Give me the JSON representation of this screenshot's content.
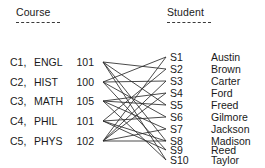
{
  "headers": {
    "course": "Course",
    "student": "Student"
  },
  "courses": [
    {
      "id": "C1,",
      "name": "ENGL",
      "number": "101"
    },
    {
      "id": "C2,",
      "name": "HIST",
      "number": "100"
    },
    {
      "id": "C3,",
      "name": "MATH",
      "number": "105"
    },
    {
      "id": "C4,",
      "name": "PHIL",
      "number": "101"
    },
    {
      "id": "C5,",
      "name": "PHYS",
      "number": "102"
    }
  ],
  "students": [
    {
      "id": "S1",
      "name": "Austin"
    },
    {
      "id": "S2",
      "name": "Brown"
    },
    {
      "id": "S3",
      "name": "Carter"
    },
    {
      "id": "S4",
      "name": "Ford"
    },
    {
      "id": "S5",
      "name": "Freed"
    },
    {
      "id": "S6",
      "name": "Gilmore"
    },
    {
      "id": "S7",
      "name": "Jackson"
    },
    {
      "id": "S8",
      "name": "Madison"
    },
    {
      "id": "S9",
      "name": "Reed"
    },
    {
      "id": "S10",
      "name": "Taylor"
    }
  ],
  "chart_data": {
    "type": "bipartite-graph",
    "title": "",
    "left_axis_label": "Course",
    "right_axis_label": "Student",
    "left_nodes": [
      "C1",
      "C2",
      "C3",
      "C4",
      "C5"
    ],
    "right_nodes": [
      "S1",
      "S2",
      "S3",
      "S4",
      "S5",
      "S6",
      "S7",
      "S8",
      "S9",
      "S10"
    ],
    "edges": [
      [
        "C1",
        "S2"
      ],
      [
        "C1",
        "S5"
      ],
      [
        "C1",
        "S8"
      ],
      [
        "C1",
        "S10"
      ],
      [
        "C2",
        "S1"
      ],
      [
        "C2",
        "S3"
      ],
      [
        "C2",
        "S6"
      ],
      [
        "C2",
        "S9"
      ],
      [
        "C3",
        "S4"
      ],
      [
        "C3",
        "S5"
      ],
      [
        "C3",
        "S7"
      ],
      [
        "C3",
        "S10"
      ],
      [
        "C4",
        "S2"
      ],
      [
        "C4",
        "S6"
      ],
      [
        "C4",
        "S8"
      ],
      [
        "C4",
        "S9"
      ],
      [
        "C5",
        "S1"
      ],
      [
        "C5",
        "S3"
      ],
      [
        "C5",
        "S4"
      ],
      [
        "C5",
        "S7"
      ],
      [
        "C5",
        "S8"
      ]
    ],
    "edge_color": "#2b2b2b",
    "node_label_color": "#1a1a1a",
    "background": "#ffffff"
  },
  "geometry": {
    "left_x": 103,
    "right_x": 166,
    "course_y": [
      62,
      82,
      101,
      121,
      141
    ],
    "student_y": [
      57,
      69,
      81,
      93,
      105,
      117,
      129,
      141,
      150,
      160
    ],
    "course_text_y": [
      56,
      76,
      95,
      115,
      135
    ],
    "student_text_y": [
      51,
      63,
      75,
      87,
      99,
      111,
      123,
      135,
      144,
      154
    ]
  }
}
